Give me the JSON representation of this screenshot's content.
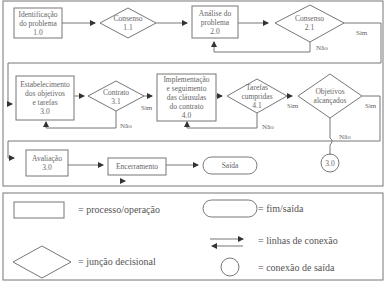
{
  "flowchart": {
    "nodes": {
      "n1_0": {
        "lines": [
          "Identificação",
          "do problema",
          "1.0"
        ],
        "shape": "process"
      },
      "n1_1": {
        "lines": [
          "Consenso",
          "1.1"
        ],
        "shape": "decision"
      },
      "n2_0": {
        "lines": [
          "Análise do",
          "problema",
          "2.0"
        ],
        "shape": "process"
      },
      "n2_1": {
        "lines": [
          "Consenso",
          "2.1"
        ],
        "shape": "decision"
      },
      "n3_0": {
        "lines": [
          "Estabelecimento",
          "dos objetivos",
          "e tarefas",
          "3.0"
        ],
        "shape": "process"
      },
      "n3_1": {
        "lines": [
          "Contrato",
          "3.1"
        ],
        "shape": "decision"
      },
      "n4_0": {
        "lines": [
          "Implementação",
          "e seguimento",
          "das cláusulas",
          "do contrato",
          "4.0"
        ],
        "shape": "process"
      },
      "n4_1": {
        "lines": [
          "Tarefas",
          "cumpridas",
          "4.1"
        ],
        "shape": "decision"
      },
      "n_obj": {
        "lines": [
          "Objetivos",
          "alcançados"
        ],
        "shape": "decision"
      },
      "n_conn": {
        "lines": [
          "3.0"
        ],
        "shape": "connector"
      },
      "n_aval": {
        "lines": [
          "Avaliação",
          "3.0"
        ],
        "shape": "process"
      },
      "n_enc": {
        "lines": [
          "Encerramento"
        ],
        "shape": "process"
      },
      "n_saida": {
        "lines": [
          "Saída"
        ],
        "shape": "terminal"
      }
    },
    "edge_labels": {
      "sim": "Sim",
      "nao": "Não"
    }
  },
  "legend": {
    "process": "= processo/operação",
    "decision": "= junção decisional",
    "terminal": "= fim/saída",
    "lines": "= linhas de conexão",
    "connector": "= conexão de saída"
  }
}
